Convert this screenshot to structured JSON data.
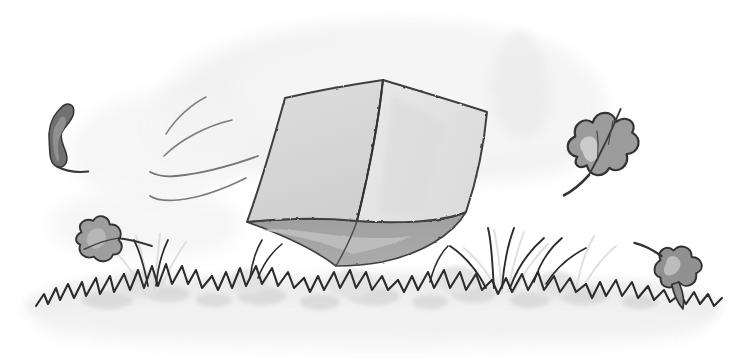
{
  "image": {
    "title": "Windblown cube in grass",
    "width": 748,
    "height": 361,
    "medium": "pencil and grey wash line drawing",
    "background_color": "#ffffff"
  },
  "palette": {
    "paper": "#ffffff",
    "sky_wash": "#ededee",
    "sky_wash_soft": "#f3f3f4",
    "ground_wash": "#ebebec",
    "ground_wash_soft": "#f2f2f3",
    "grass_clump": "#d9d9d9",
    "grass_clump_light": "#e4e4e4",
    "ink": "#2b2b2b",
    "ink_soft": "#4a4a4a",
    "ink_faint": "#6f6f6f",
    "cube_left_face": "#d8d8d8",
    "cube_right_face": "#e6e6e6",
    "cube_under_dark": "#9a9a9a",
    "cube_under_mid": "#b4b4b4",
    "cube_outline": "#3a3a3a",
    "leaf_dark": "#6b6b6b",
    "leaf_mid": "#8e8e8e",
    "leaf_light": "#b9b9b9",
    "leaf_outline": "#3d3d3d"
  },
  "objects": {
    "cube": {
      "label": "tumbling open cube",
      "apex_top": [
        383,
        80
      ],
      "corner_left": [
        285,
        98
      ],
      "corner_right": [
        487,
        112
      ],
      "corner_left_bottom": [
        247,
        222
      ],
      "corner_right_bottom": [
        466,
        212
      ],
      "corner_bottom": [
        336,
        266
      ],
      "front_edge_bottom": [
        357,
        221
      ],
      "faces": [
        {
          "name": "left-face",
          "tone": "#d8d8d8"
        },
        {
          "name": "right-face",
          "tone": "#e6e6e6"
        },
        {
          "name": "underside-dark",
          "tone": "#9a9a9a"
        },
        {
          "name": "underside-mid",
          "tone": "#b4b4b4"
        }
      ]
    },
    "wind_lines": {
      "label": "three curved motion streaks",
      "count": 3,
      "region": [
        150,
        95,
        120,
        100
      ]
    },
    "leaves": [
      {
        "name": "leaf-upper-left",
        "x": 52,
        "y": 118,
        "tone": "#6b6b6b",
        "rotation": -20
      },
      {
        "name": "leaf-mid-left",
        "x": 82,
        "y": 228,
        "tone": "#9a9a9a",
        "rotation": 8
      },
      {
        "name": "leaf-right",
        "x": 572,
        "y": 146,
        "tone": "#8e8e8e",
        "rotation": -30
      },
      {
        "name": "leaf-lower-right",
        "x": 662,
        "y": 254,
        "tone": "#8e8e8e",
        "rotation": 15
      }
    ],
    "grass": {
      "label": "band of zigzag grass tufts across the lower third",
      "baseline_y": 300,
      "tuft_count": 14
    },
    "ground": {
      "label": "pale grey ground wash band",
      "top_y": 262,
      "bottom_y": 330
    }
  }
}
